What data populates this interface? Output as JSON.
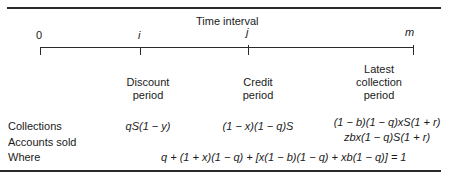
{
  "header": {
    "title": "Time interval"
  },
  "timeline": {
    "points": [
      {
        "label": "0",
        "italic": false
      },
      {
        "label": "i",
        "italic": true
      },
      {
        "label": "j",
        "italic": true
      },
      {
        "label": "m",
        "italic": true
      }
    ]
  },
  "periods": [
    {
      "line1": "Discount",
      "line2": "period"
    },
    {
      "line1": "Credit",
      "line2": "period"
    },
    {
      "line1": "Latest",
      "line2": "collection",
      "line3": "period"
    }
  ],
  "rows": {
    "collections": {
      "label": "Collections",
      "discount": "qS(1 − y)",
      "credit": "(1 − x)(1 − q)S",
      "latest": "(1 − b)(1 − q)xS(1 + r)"
    },
    "accounts_sold": {
      "label": "Accounts sold",
      "latest": "zbx(1 − q)S(1 + r)"
    },
    "where": {
      "label": "Where",
      "equation": "q + (1 + x)(1 − q) + [x(1 − b)(1 − q) + xb(1 − q)] = 1"
    }
  }
}
